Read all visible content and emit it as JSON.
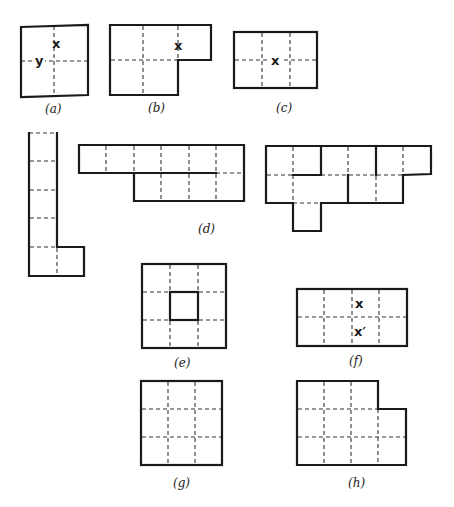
{
  "figure": {
    "type": "polyomino-diagram",
    "panels": [
      {
        "id": "a",
        "caption": "(a)",
        "shape": "2x2 square",
        "marks": [
          "x",
          "y"
        ]
      },
      {
        "id": "b",
        "caption": "(b)",
        "shape": "5-cell P-shape (3 top, 2 bottom)",
        "marks": [
          "x"
        ]
      },
      {
        "id": "c",
        "caption": "(c)",
        "shape": "3x2 rectangle",
        "marks": [
          "x"
        ]
      },
      {
        "id": "d",
        "caption": "(d)",
        "shape": "three polyomino pieces (L-shape, 10-cell strip, 13-cell irregular)",
        "marks": []
      },
      {
        "id": "e",
        "caption": "(e)",
        "shape": "3x3 square with solid-bordered center cell",
        "marks": []
      },
      {
        "id": "f",
        "caption": "(f)",
        "shape": "4x2 rectangle",
        "marks": [
          "x",
          "x′"
        ]
      },
      {
        "id": "g",
        "caption": "(g)",
        "shape": "3x3 square",
        "marks": []
      },
      {
        "id": "h",
        "caption": "(h)",
        "shape": "4x3 rectangle missing top-right cell",
        "marks": []
      }
    ]
  },
  "labels": {
    "a": "(a)",
    "b": "(b)",
    "c": "(c)",
    "d": "(d)",
    "e": "(e)",
    "f": "(f)",
    "g": "(g)",
    "h": "(h)"
  },
  "marks": {
    "a_x": "x",
    "a_y": "y",
    "b_x": "x",
    "c_x": "x",
    "f_x": "x",
    "f_xprime": "x′"
  },
  "colors": {
    "line": "#1a1a1a",
    "background": "#ffffff"
  }
}
